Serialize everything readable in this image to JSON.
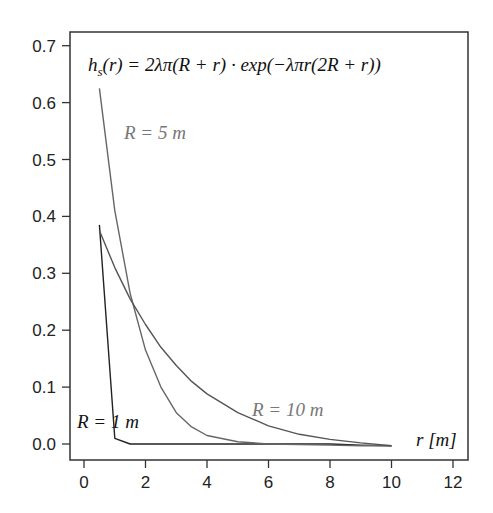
{
  "chart_data": {
    "type": "line",
    "xlabel": "r [m]",
    "ylabel": "",
    "xlim": [
      -0.4,
      12.5
    ],
    "ylim": [
      -0.03,
      0.725
    ],
    "xticks": [
      0,
      2,
      4,
      6,
      8,
      10,
      12
    ],
    "yticks": [
      0.0,
      0.1,
      0.2,
      0.3,
      0.4,
      0.5,
      0.6,
      0.7
    ],
    "xtick_labels": [
      "0",
      "2",
      "4",
      "6",
      "8",
      "10",
      "12"
    ],
    "ytick_labels": [
      "0.0",
      "0.1",
      "0.2",
      "0.3",
      "0.4",
      "0.5",
      "0.6",
      "0.7"
    ],
    "grid": false,
    "legend": null,
    "annotations": [
      {
        "text": "R = 5 m",
        "x": 1.3,
        "y": 0.545,
        "color": "#777777"
      },
      {
        "text": "R = 10 m",
        "x": 5.2,
        "y": 0.025,
        "color": "#777777"
      },
      {
        "text": "R = 1 m",
        "x": -0.3,
        "y": -0.005,
        "color": "#111111"
      }
    ],
    "series": [
      {
        "name": "R = 1 m",
        "color": "#222222",
        "x": [
          0.5,
          1.0,
          1.5,
          2,
          3,
          4,
          5,
          6,
          7,
          8,
          9,
          10
        ],
        "y": [
          0.385,
          0.01,
          0.0,
          0.0,
          0.0,
          0.0,
          0.0,
          0.0,
          0.0,
          0.0,
          -0.002,
          -0.003
        ]
      },
      {
        "name": "R = 5 m",
        "color": "#666666",
        "x": [
          0.5,
          1.0,
          1.5,
          2.0,
          2.5,
          3.0,
          3.5,
          4.0,
          5.0,
          6.0,
          7.0,
          8.0,
          9.0,
          10.0
        ],
        "y": [
          0.625,
          0.41,
          0.265,
          0.165,
          0.1,
          0.055,
          0.03,
          0.015,
          0.004,
          0.0,
          -0.001,
          -0.002,
          -0.003,
          -0.003
        ]
      },
      {
        "name": "R = 10 m",
        "color": "#555555",
        "x": [
          0.5,
          1.0,
          1.5,
          2.0,
          2.5,
          3.0,
          3.5,
          4.0,
          5.0,
          6.0,
          7.0,
          8.0,
          9.0,
          10.0
        ],
        "y": [
          0.375,
          0.31,
          0.255,
          0.21,
          0.17,
          0.138,
          0.11,
          0.088,
          0.055,
          0.032,
          0.017,
          0.008,
          0.002,
          -0.003
        ]
      }
    ]
  },
  "labels": {
    "formula": "h",
    "formula_sub": "s",
    "formula_rest": "(r) = 2λπ(R + r) · exp(−λπr(2R + r))",
    "r5": "R = 5 m",
    "r10": "R = 10 m",
    "r1": "R = 1 m",
    "xlabel": "r [m]"
  }
}
